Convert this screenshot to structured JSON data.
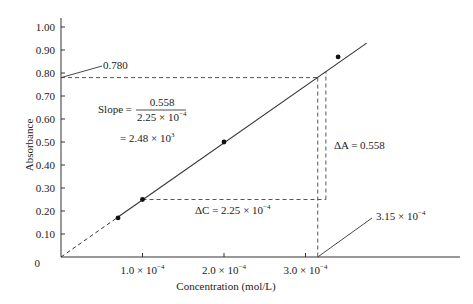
{
  "chart_data": {
    "type": "line",
    "title": "",
    "xlabel": "Concentration (mol/L)",
    "ylabel": "Absorbance",
    "xlim": [
      0,
      0.00045
    ],
    "ylim": [
      0,
      1.05
    ],
    "grid": false,
    "x_ticks": [
      {
        "value": 0.0001,
        "mantissa": "1.0",
        "exp": "−4"
      },
      {
        "value": 0.0002,
        "mantissa": "2.0",
        "exp": "−4"
      },
      {
        "value": 0.0003,
        "mantissa": "3.0",
        "exp": "−4"
      }
    ],
    "y_ticks": [
      {
        "value": 0,
        "label": "0"
      },
      {
        "value": 0.1,
        "label": "0.10"
      },
      {
        "value": 0.2,
        "label": "0.20"
      },
      {
        "value": 0.3,
        "label": "0.30"
      },
      {
        "value": 0.4,
        "label": "0.40"
      },
      {
        "value": 0.5,
        "label": "0.50"
      },
      {
        "value": 0.6,
        "label": "0.60"
      },
      {
        "value": 0.7,
        "label": "0.70"
      },
      {
        "value": 0.8,
        "label": "0.80"
      },
      {
        "value": 0.9,
        "label": "0.90"
      },
      {
        "value": 1.0,
        "label": "1.00"
      }
    ],
    "series": [
      {
        "name": "Calibration data",
        "x": [
          7e-05,
          0.0001,
          0.0002,
          0.00034
        ],
        "y": [
          0.17,
          0.25,
          0.5,
          0.87
        ]
      }
    ],
    "fit_line": {
      "x_start": 0,
      "y_start": 0,
      "x_end": 0.000375,
      "y_end": 0.93,
      "dashed_until_x": 7e-05
    },
    "annotations": {
      "y_callout": {
        "label": "0.780",
        "value": 0.78
      },
      "x_callout": {
        "mantissa": "3.15",
        "exp": "−4",
        "value": 0.000315
      },
      "slope_label": "Slope =",
      "slope_numerator": "0.558",
      "slope_denominator_mantissa": "2.25",
      "slope_denominator_exp": "−4",
      "slope_result_mantissa": "= 2.48",
      "slope_result_exp": "3",
      "delta_a": {
        "label": "ΔA = 0.558",
        "value": 0.558
      },
      "delta_c": {
        "label_prefix": "ΔC = 2.25",
        "exp": "−4",
        "value": 0.000225
      },
      "triangle": {
        "x1": 0.0001,
        "y1": 0.25,
        "x2": 0.000325,
        "y2": 0.808
      }
    }
  }
}
